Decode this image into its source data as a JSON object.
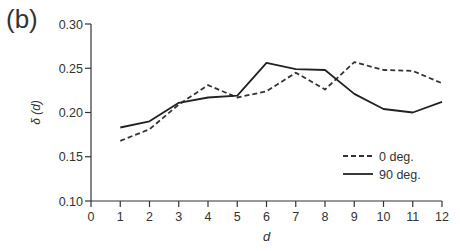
{
  "panel_label": "(b)",
  "chart_data": {
    "type": "line",
    "title": "",
    "xlabel": "d",
    "ylabel": "δ (d)",
    "xlim": [
      0,
      12
    ],
    "ylim": [
      0.1,
      0.3
    ],
    "x_ticks": [
      0,
      1,
      2,
      3,
      4,
      5,
      6,
      7,
      8,
      9,
      10,
      11,
      12
    ],
    "y_ticks": [
      "0.10",
      "0.15",
      "0.20",
      "0.25",
      "0.30"
    ],
    "grid": false,
    "legend_position": "lower right",
    "x": [
      1,
      2,
      3,
      4,
      5,
      6,
      7,
      8,
      9,
      10,
      11,
      12
    ],
    "series": [
      {
        "name": "0 deg.",
        "style": "dashed",
        "color": "#333333",
        "values": [
          0.168,
          0.181,
          0.209,
          0.231,
          0.217,
          0.224,
          0.245,
          0.226,
          0.257,
          0.248,
          0.247,
          0.233
        ]
      },
      {
        "name": "90 deg.",
        "style": "solid",
        "color": "#222222",
        "values": [
          0.183,
          0.19,
          0.211,
          0.217,
          0.219,
          0.256,
          0.249,
          0.248,
          0.221,
          0.204,
          0.2,
          0.212
        ]
      }
    ]
  }
}
